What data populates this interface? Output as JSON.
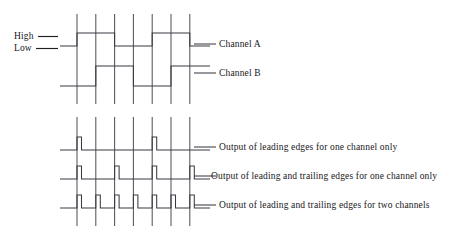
{
  "figure": {
    "type": "timing-diagram",
    "title": "",
    "background": "#ffffff",
    "line_color": "#3a3a42",
    "guide_color": "#53535c",
    "text_color": "#17171a"
  },
  "axis_labels": {
    "high": "High",
    "low": "Low"
  },
  "signal_labels": {
    "channel_a": "Channel A",
    "channel_b": "Channel B",
    "output_1": "Output of leading edges for one channel only",
    "output_2": "Output of leading and trailing edges for one channel only",
    "output_3": "Output of leading and trailing edges for two channels"
  },
  "chart_data": {
    "type": "line",
    "xlabel": "",
    "ylabel": "",
    "grid": true,
    "legend": "right",
    "x_guidelines": [
      77.0,
      95.8,
      114.6,
      133.4,
      152.2,
      171.0,
      189.8
    ],
    "guide_count": 7,
    "guide_spacing_px": 18.8,
    "plot_left_px": 60,
    "plot_right_px": 210,
    "levels": {
      "high": "High",
      "low": "Low"
    },
    "series": [
      {
        "name": "Channel A",
        "label_y_px": 44,
        "high_y_px": 33,
        "low_y_px": 46,
        "lead_in_from_px": 60,
        "lead_out_to_px": 210,
        "start_level": "low",
        "transitions_px": [
          77.0,
          114.6,
          152.2,
          189.8
        ],
        "pulses": [
          {
            "rise_px": 77.0,
            "fall_px": 114.6
          },
          {
            "rise_px": 152.2,
            "fall_px": 189.8
          }
        ]
      },
      {
        "name": "Channel B",
        "label_y_px": 73,
        "high_y_px": 66,
        "low_y_px": 86,
        "lead_in_from_px": 60,
        "lead_out_to_px": 210,
        "start_level": "low",
        "phase_shift_px": 18.8,
        "transitions_px": [
          95.8,
          133.4,
          171.0
        ],
        "pulses": [
          {
            "rise_px": 95.8,
            "fall_px": 133.4
          },
          {
            "rise_px": 171.0,
            "fall_px": 210.0
          }
        ]
      },
      {
        "name": "Output of leading edges for one channel only",
        "label_y_px": 147,
        "high_y_px": 137,
        "low_y_px": 150,
        "lead_in_from_px": 60,
        "lead_out_to_px": 210,
        "pulse_width_px": 4.5,
        "pulse_edges_px": [
          77.0,
          152.2
        ],
        "pulse_count": 2,
        "resolution": "1x"
      },
      {
        "name": "Output of leading and trailing edges for one channel only",
        "label_y_px": 176,
        "high_y_px": 166,
        "low_y_px": 179,
        "lead_in_from_px": 60,
        "lead_out_to_px": 210,
        "pulse_width_px": 4.5,
        "pulse_edges_px": [
          77.0,
          114.6,
          152.2,
          189.8
        ],
        "pulse_count": 4,
        "resolution": "2x"
      },
      {
        "name": "Output of leading and trailing edges for two channels",
        "label_y_px": 205,
        "high_y_px": 195,
        "low_y_px": 208,
        "lead_in_from_px": 60,
        "lead_out_to_px": 210,
        "pulse_width_px": 4.5,
        "pulse_edges_px": [
          77.0,
          95.8,
          114.6,
          133.4,
          152.2,
          171.0,
          189.8
        ],
        "pulse_count": 7,
        "resolution": "4x"
      }
    ],
    "guide_spans": [
      {
        "name": "upper-block",
        "y_top_px": 14,
        "y_bottom_px": 104
      },
      {
        "name": "lower-block",
        "y_top_px": 117,
        "y_bottom_px": 226
      }
    ]
  }
}
